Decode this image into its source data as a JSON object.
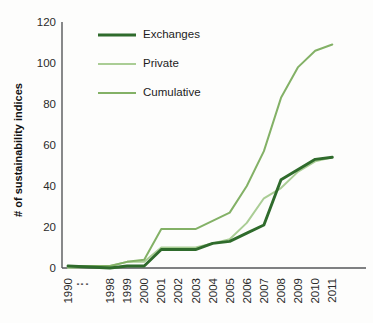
{
  "chart_data": {
    "type": "line",
    "title": "",
    "xlabel": "",
    "ylabel": "# of sustainability indices",
    "ylim": [
      0,
      120
    ],
    "yticks": [
      0,
      20,
      40,
      60,
      80,
      100,
      120
    ],
    "grid": false,
    "legend_position": "top-center",
    "axis_break_after_index": 0,
    "axis_break_symbol": "⋮",
    "categories": [
      "1990",
      "1998",
      "1999",
      "2000",
      "2001",
      "2002",
      "2003",
      "2004",
      "2005",
      "2006",
      "2007",
      "2008",
      "2009",
      "2010",
      "2011"
    ],
    "series": [
      {
        "name": "Exchanges",
        "color": "#2f6b2c",
        "values": [
          1,
          0,
          1,
          1,
          9,
          9,
          9,
          12,
          13,
          17,
          21,
          43,
          48,
          53,
          54
        ]
      },
      {
        "name": "Private",
        "color": "#aacd95",
        "values": [
          0,
          1,
          3,
          3,
          10,
          10,
          10,
          12,
          14,
          22,
          34,
          39,
          47,
          52,
          54
        ]
      },
      {
        "name": "Cumulative",
        "color": "#83b166",
        "values": [
          1,
          1,
          3,
          4,
          19,
          19,
          19,
          23,
          27,
          40,
          57,
          83,
          98,
          106,
          109
        ]
      }
    ]
  },
  "legend": {
    "items": [
      {
        "label": "Exchanges",
        "color": "#2f6b2c",
        "width": 2.8
      },
      {
        "label": "Private",
        "color": "#aacd95",
        "width": 2.0
      },
      {
        "label": "Cumulative",
        "color": "#83b166",
        "width": 2.0
      }
    ]
  },
  "axis": {
    "y_label": "# of sustainability indices",
    "y_tick_labels": [
      "120",
      "100",
      "80",
      "60",
      "40",
      "20",
      "0"
    ],
    "x_tick_labels": [
      "1990",
      "⋮",
      "1998",
      "1999",
      "2000",
      "2001",
      "2002",
      "2003",
      "2004",
      "2005",
      "2006",
      "2007",
      "2008",
      "2009",
      "2010",
      "2011"
    ]
  },
  "colors": {
    "exchanges": "#2f6b2c",
    "private": "#aacd95",
    "cumulative": "#83b166",
    "axis": "#55565a",
    "text": "#2b2b2b",
    "background": "#fdfdfc"
  }
}
